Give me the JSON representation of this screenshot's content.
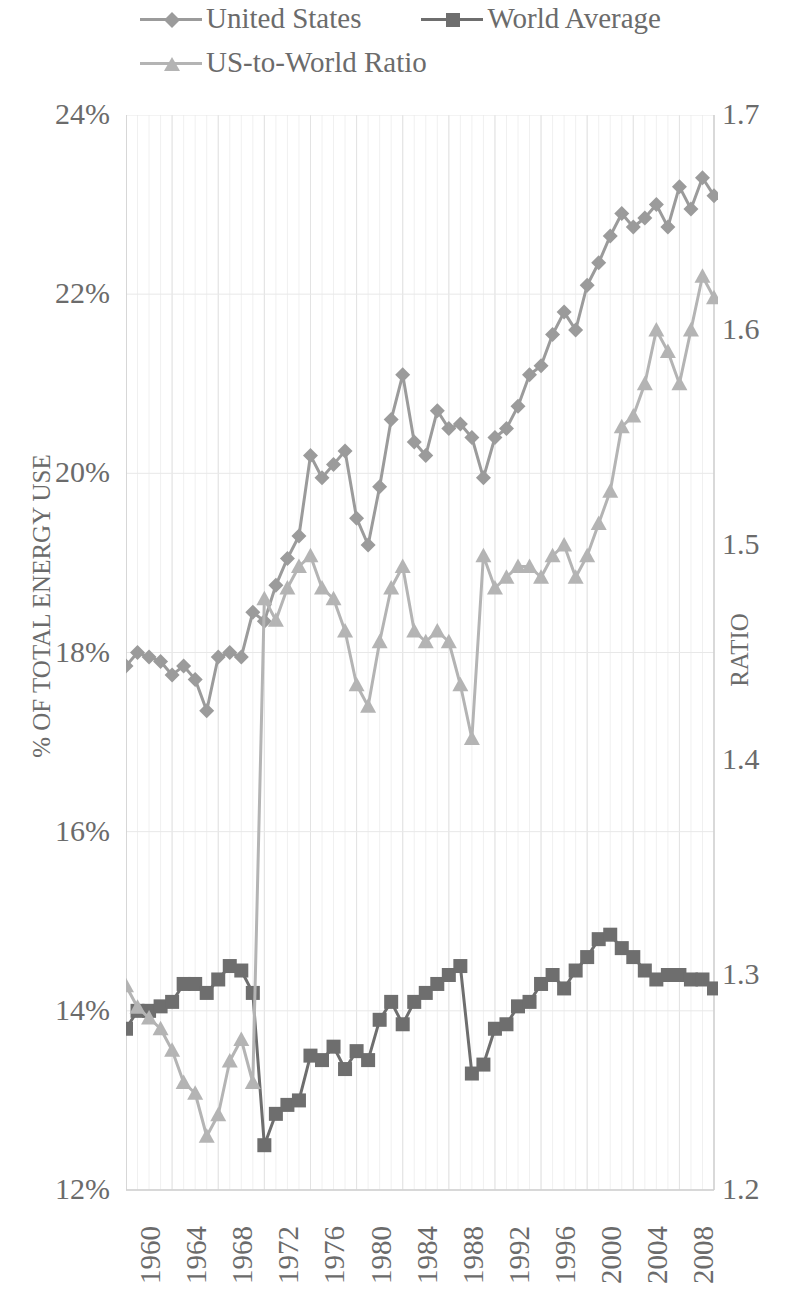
{
  "legend": {
    "items": [
      {
        "label": "United States",
        "marker": "diamond-marker",
        "color": "#9b9b9b"
      },
      {
        "label": "World Average",
        "marker": "square-marker",
        "color": "#6e6e6e"
      },
      {
        "label": "US-to-World Ratio",
        "marker": "triangle-marker",
        "color": "#b4b4b4"
      }
    ]
  },
  "axes": {
    "y_left_title": "% OF TOTAL ENERGY USE",
    "y_right_title": "RATIO",
    "y_left_ticks": [
      "24%",
      "22%",
      "20%",
      "18%",
      "16%",
      "14%",
      "12%"
    ],
    "y_right_ticks": [
      "1.7",
      "1.6",
      "1.5",
      "1.4",
      "1.3",
      "1.2"
    ],
    "x_ticks": [
      "1960",
      "1964",
      "1968",
      "1972",
      "1976",
      "1980",
      "1984",
      "1988",
      "1992",
      "1996",
      "2000",
      "2004",
      "2008"
    ]
  },
  "chart_data": {
    "type": "line",
    "title": "",
    "xlabel": "",
    "ylabel": "% OF TOTAL ENERGY USE",
    "y2label": "RATIO",
    "ylim": [
      12,
      24
    ],
    "y2lim": [
      1.2,
      1.7
    ],
    "yticks": [
      12,
      14,
      16,
      18,
      20,
      22,
      24
    ],
    "y2ticks": [
      1.2,
      1.3,
      1.4,
      1.5,
      1.6,
      1.7
    ],
    "grid": true,
    "legend_position": "top-left",
    "x": [
      1960,
      1961,
      1962,
      1963,
      1964,
      1965,
      1966,
      1967,
      1968,
      1969,
      1970,
      1971,
      1972,
      1973,
      1974,
      1975,
      1976,
      1977,
      1978,
      1979,
      1980,
      1981,
      1982,
      1983,
      1984,
      1985,
      1986,
      1987,
      1988,
      1989,
      1990,
      1991,
      1992,
      1993,
      1994,
      1995,
      1996,
      1997,
      1998,
      1999,
      2000,
      2001,
      2002,
      2003,
      2004,
      2005,
      2006,
      2007,
      2008,
      2009,
      2010,
      2011
    ],
    "series": [
      {
        "name": "United States",
        "axis": "left",
        "unit": "%",
        "marker": "diamond",
        "color": "#9b9b9b",
        "values": [
          17.85,
          18.0,
          17.95,
          17.9,
          17.75,
          17.85,
          17.7,
          17.35,
          17.95,
          18.0,
          17.95,
          18.45,
          18.35,
          18.75,
          19.05,
          19.3,
          20.2,
          19.95,
          20.1,
          20.25,
          19.5,
          19.2,
          19.85,
          20.6,
          21.1,
          20.35,
          20.2,
          20.7,
          20.5,
          20.55,
          20.4,
          19.95,
          20.4,
          20.5,
          20.75,
          21.1,
          21.2,
          21.55,
          21.8,
          21.6,
          22.1,
          22.35,
          22.65,
          22.9,
          22.75,
          22.85,
          23.0,
          22.75,
          23.2,
          22.95,
          23.3,
          23.1
        ]
      },
      {
        "name": "World Average",
        "axis": "left",
        "unit": "%",
        "marker": "square",
        "color": "#6e6e6e",
        "values": [
          13.8,
          14.0,
          14.0,
          14.05,
          14.1,
          14.3,
          14.3,
          14.2,
          14.35,
          14.5,
          14.45,
          14.2,
          12.5,
          12.85,
          12.95,
          13.0,
          13.5,
          13.45,
          13.6,
          13.35,
          13.55,
          13.45,
          13.9,
          14.1,
          13.85,
          14.1,
          14.2,
          14.3,
          14.4,
          14.5,
          13.3,
          13.4,
          13.8,
          13.85,
          14.05,
          14.1,
          14.3,
          14.4,
          14.25,
          14.45,
          14.6,
          14.8,
          14.85,
          14.7,
          14.6,
          14.45,
          14.35,
          14.4,
          14.4,
          14.35,
          14.35,
          14.25
        ]
      },
      {
        "name": "US-to-World Ratio",
        "axis": "right",
        "unit": "ratio",
        "marker": "triangle",
        "color": "#b4b4b4",
        "values": [
          1.295,
          1.285,
          1.28,
          1.275,
          1.265,
          1.25,
          1.245,
          1.225,
          1.235,
          1.26,
          1.27,
          1.25,
          1.475,
          1.465,
          1.48,
          1.49,
          1.495,
          1.48,
          1.475,
          1.46,
          1.435,
          1.425,
          1.455,
          1.48,
          1.49,
          1.46,
          1.455,
          1.46,
          1.455,
          1.435,
          1.41,
          1.495,
          1.48,
          1.485,
          1.49,
          1.49,
          1.485,
          1.495,
          1.5,
          1.485,
          1.495,
          1.51,
          1.525,
          1.555,
          1.56,
          1.575,
          1.6,
          1.59,
          1.575,
          1.6,
          1.625,
          1.615
        ]
      }
    ]
  }
}
